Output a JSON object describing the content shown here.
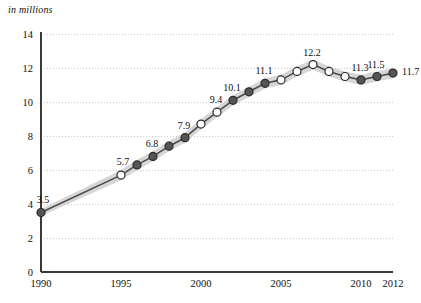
{
  "chart_data": {
    "type": "line",
    "title": "",
    "subtitle": "",
    "xlabel": "",
    "ylabel": "in millions",
    "units_caption": "in millions",
    "xlim": [
      1990,
      2012
    ],
    "ylim": [
      0,
      14
    ],
    "grid": true,
    "legend": "none",
    "x_ticks": [
      "1990",
      "1995",
      "2000",
      "2005",
      "2010",
      "2012"
    ],
    "x_tick_values": [
      1990,
      1995,
      2000,
      2005,
      2010,
      2012
    ],
    "y_ticks": [
      "0",
      "2",
      "4",
      "6",
      "8",
      "10",
      "12",
      "14"
    ],
    "y_tick_values": [
      0,
      2,
      4,
      6,
      8,
      10,
      12,
      14
    ],
    "x": [
      1990,
      1995,
      1996,
      1997,
      1998,
      1999,
      2000,
      2001,
      2002,
      2003,
      2004,
      2005,
      2006,
      2007,
      2008,
      2009,
      2010,
      2011,
      2012
    ],
    "series": [
      {
        "name": "estimate",
        "values": [
          3.5,
          5.7,
          6.3,
          6.8,
          7.4,
          7.9,
          8.7,
          9.4,
          10.1,
          10.6,
          11.1,
          11.3,
          11.8,
          12.2,
          11.8,
          11.5,
          11.3,
          11.5,
          11.7
        ],
        "band_low": [
          3.3,
          5.4,
          6.0,
          6.5,
          7.1,
          7.6,
          8.4,
          9.1,
          9.8,
          10.3,
          10.8,
          11.0,
          11.5,
          11.9,
          11.5,
          11.2,
          11.0,
          11.2,
          11.4
        ],
        "band_high": [
          3.7,
          6.0,
          6.6,
          7.1,
          7.7,
          8.2,
          9.0,
          9.7,
          10.4,
          10.9,
          11.4,
          11.6,
          12.1,
          12.5,
          12.1,
          11.8,
          11.6,
          11.8,
          12.0
        ],
        "marker_styles": [
          "filled",
          "open",
          "filled",
          "filled",
          "filled",
          "filled",
          "open",
          "open",
          "filled",
          "filled",
          "filled",
          "open",
          "open",
          "open",
          "open",
          "open",
          "filled",
          "filled",
          "filled"
        ]
      }
    ],
    "point_labels": [
      {
        "x": 1990,
        "value": "3.5",
        "placement": "above-left"
      },
      {
        "x": 1995,
        "value": "5.7",
        "placement": "above-left"
      },
      {
        "x": 1997,
        "value": "6.8",
        "placement": "above"
      },
      {
        "x": 1999,
        "value": "7.9",
        "placement": "above"
      },
      {
        "x": 2001,
        "value": "9.4",
        "placement": "above"
      },
      {
        "x": 2002,
        "value": "10.1",
        "placement": "above"
      },
      {
        "x": 2004,
        "value": "11.1",
        "placement": "above"
      },
      {
        "x": 2007,
        "value": "12.2",
        "placement": "above"
      },
      {
        "x": 2010,
        "value": "11.3",
        "placement": "above"
      },
      {
        "x": 2011,
        "value": "11.5",
        "placement": "above"
      },
      {
        "x": 2012,
        "value": "11.7",
        "placement": "right"
      }
    ],
    "colors": {
      "line": "#4d4d4d",
      "band": "#d4d4d4",
      "marker_fill": "#555555",
      "marker_open": "#ffffff",
      "marker_stroke": "#2b2b2b",
      "grid": "#c9c9c9",
      "axis": "#3a3a3a",
      "text": "#111111",
      "background": "#ffffff"
    }
  }
}
